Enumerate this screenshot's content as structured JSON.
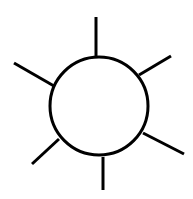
{
  "diagram": {
    "title": "",
    "background": "#ffffff",
    "stroke_color": "#000000",
    "stroke_width": 3,
    "circle": {
      "cx": 99,
      "cy": 106,
      "r": 49
    },
    "spokes": [
      {
        "name": "spoke-top",
        "x1": 96,
        "y1": 17,
        "x2": 96,
        "y2": 56
      },
      {
        "name": "spoke-upper-right",
        "x1": 139,
        "y1": 75,
        "x2": 171,
        "y2": 56
      },
      {
        "name": "spoke-upper-left",
        "x1": 14,
        "y1": 63,
        "x2": 54,
        "y2": 86
      },
      {
        "name": "spoke-lower-right",
        "x1": 143,
        "y1": 133,
        "x2": 184,
        "y2": 154
      },
      {
        "name": "spoke-lower-left",
        "x1": 32,
        "y1": 164,
        "x2": 59,
        "y2": 139
      },
      {
        "name": "spoke-bottom",
        "x1": 103,
        "y1": 157,
        "x2": 103,
        "y2": 190
      }
    ]
  }
}
